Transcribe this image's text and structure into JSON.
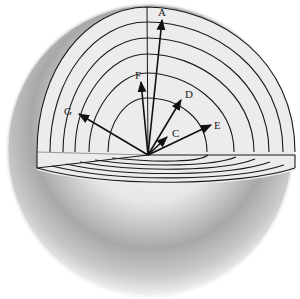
{
  "figure": {
    "origin": {
      "x": 148,
      "y": 155
    },
    "shell_count": 7,
    "colors": {
      "line": "#1a1a1a",
      "shell_fill": "#ececec",
      "sphere_light": "#f7f7f7",
      "sphere_dark": "#9a9a9a"
    }
  },
  "vectors": [
    {
      "label": "A",
      "tip": {
        "x": 162,
        "y": 20
      },
      "label_pos": {
        "x": 158,
        "y": 16
      }
    },
    {
      "label": "F",
      "tip": {
        "x": 141,
        "y": 82
      },
      "label_pos": {
        "x": 135,
        "y": 79
      }
    },
    {
      "label": "D",
      "tip": {
        "x": 181,
        "y": 100
      },
      "label_pos": {
        "x": 185,
        "y": 98
      }
    },
    {
      "label": "G",
      "tip": {
        "x": 79,
        "y": 114
      },
      "label_pos": {
        "x": 64,
        "y": 115
      }
    },
    {
      "label": "E",
      "tip": {
        "x": 211,
        "y": 125
      },
      "label_pos": {
        "x": 214,
        "y": 129
      }
    },
    {
      "label": "C",
      "tip": {
        "x": 167,
        "y": 137
      },
      "label_pos": {
        "x": 172,
        "y": 137
      }
    }
  ]
}
